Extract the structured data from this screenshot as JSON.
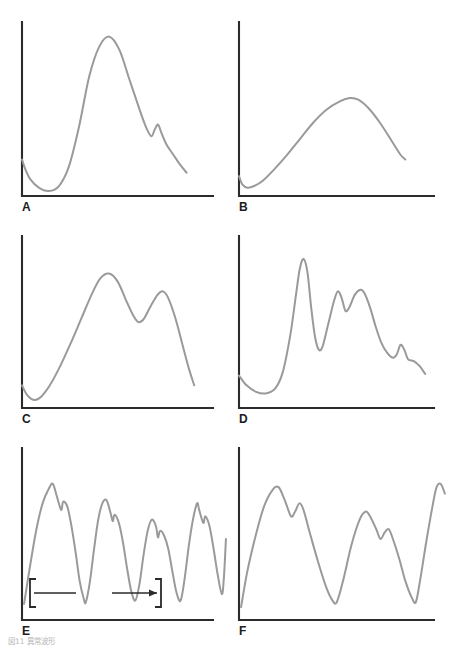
{
  "figure": {
    "caption": "図11 異常波形",
    "line_color": "#9a9a9a",
    "axis_color": "#2b2b2b",
    "background": "#ffffff"
  },
  "panels": [
    {
      "label": "A",
      "description": "single tall peak with small secondary notch on descending limb"
    },
    {
      "label": "B",
      "description": "single broad rounded low hump"
    },
    {
      "label": "C",
      "description": "bimodal curve with two rounded peaks"
    },
    {
      "label": "D",
      "description": "jagged multi-peaked waveform with tall spike and stepped tail"
    },
    {
      "label": "E",
      "description": "repeating irregular notched respiratory cycles"
    },
    {
      "label": "F",
      "description": "three repeating notched respiratory cycles"
    }
  ],
  "annotation": {
    "label": "吸気",
    "panel": "E"
  },
  "chart_data": {
    "type": "line",
    "title": "図11 異常波形",
    "grid": false,
    "legend": false,
    "xlabel": "",
    "ylabel": "",
    "panels": [
      {
        "id": "A",
        "label": "A",
        "xlim": [
          0,
          100
        ],
        "ylim": [
          0,
          100
        ],
        "points": [
          [
            0,
            22
          ],
          [
            2,
            16
          ],
          [
            5,
            10
          ],
          [
            10,
            5
          ],
          [
            16,
            3
          ],
          [
            22,
            6
          ],
          [
            28,
            18
          ],
          [
            34,
            42
          ],
          [
            40,
            72
          ],
          [
            46,
            90
          ],
          [
            52,
            96
          ],
          [
            58,
            88
          ],
          [
            64,
            70
          ],
          [
            70,
            52
          ],
          [
            74,
            41
          ],
          [
            77,
            36
          ],
          [
            79,
            40
          ],
          [
            81,
            43
          ],
          [
            83,
            38
          ],
          [
            86,
            31
          ],
          [
            90,
            25
          ],
          [
            94,
            19
          ],
          [
            98,
            14
          ]
        ]
      },
      {
        "id": "B",
        "label": "B",
        "xlim": [
          0,
          100
        ],
        "ylim": [
          0,
          100
        ],
        "points": [
          [
            0,
            12
          ],
          [
            2,
            7
          ],
          [
            5,
            5
          ],
          [
            9,
            6
          ],
          [
            14,
            9
          ],
          [
            20,
            15
          ],
          [
            28,
            24
          ],
          [
            36,
            34
          ],
          [
            44,
            44
          ],
          [
            52,
            52
          ],
          [
            60,
            57
          ],
          [
            66,
            59
          ],
          [
            71,
            58
          ],
          [
            77,
            53
          ],
          [
            84,
            44
          ],
          [
            91,
            33
          ],
          [
            96,
            25
          ],
          [
            99,
            22
          ]
        ]
      },
      {
        "id": "C",
        "label": "C",
        "xlim": [
          0,
          100
        ],
        "ylim": [
          0,
          100
        ],
        "points": [
          [
            0,
            14
          ],
          [
            3,
            8
          ],
          [
            7,
            5
          ],
          [
            11,
            7
          ],
          [
            16,
            14
          ],
          [
            22,
            26
          ],
          [
            28,
            40
          ],
          [
            34,
            55
          ],
          [
            40,
            70
          ],
          [
            45,
            80
          ],
          [
            50,
            83
          ],
          [
            55,
            78
          ],
          [
            60,
            66
          ],
          [
            64,
            57
          ],
          [
            67,
            53
          ],
          [
            70,
            55
          ],
          [
            74,
            63
          ],
          [
            78,
            70
          ],
          [
            81,
            72
          ],
          [
            84,
            68
          ],
          [
            88,
            56
          ],
          [
            92,
            40
          ],
          [
            96,
            24
          ],
          [
            99,
            14
          ]
        ]
      },
      {
        "id": "D",
        "label": "D",
        "xlim": [
          0,
          100
        ],
        "ylim": [
          0,
          100
        ],
        "points": [
          [
            0,
            20
          ],
          [
            4,
            14
          ],
          [
            9,
            10
          ],
          [
            14,
            9
          ],
          [
            19,
            12
          ],
          [
            23,
            22
          ],
          [
            27,
            45
          ],
          [
            30,
            70
          ],
          [
            32,
            86
          ],
          [
            34,
            92
          ],
          [
            36,
            84
          ],
          [
            38,
            62
          ],
          [
            40,
            44
          ],
          [
            42,
            36
          ],
          [
            44,
            38
          ],
          [
            47,
            52
          ],
          [
            50,
            66
          ],
          [
            52,
            72
          ],
          [
            54,
            68
          ],
          [
            56,
            60
          ],
          [
            58,
            62
          ],
          [
            61,
            70
          ],
          [
            64,
            73
          ],
          [
            66,
            71
          ],
          [
            69,
            62
          ],
          [
            72,
            50
          ],
          [
            75,
            40
          ],
          [
            78,
            34
          ],
          [
            81,
            31
          ],
          [
            83,
            33
          ],
          [
            85,
            39
          ],
          [
            87,
            36
          ],
          [
            89,
            30
          ],
          [
            92,
            29
          ],
          [
            95,
            26
          ],
          [
            98,
            21
          ]
        ]
      },
      {
        "id": "E",
        "label": "E",
        "xlim": [
          0,
          100
        ],
        "ylim": [
          0,
          100
        ],
        "points": [
          [
            1,
            10
          ],
          [
            4,
            34
          ],
          [
            7,
            56
          ],
          [
            10,
            72
          ],
          [
            13,
            81
          ],
          [
            15,
            84
          ],
          [
            17,
            76
          ],
          [
            19,
            68
          ],
          [
            20,
            73
          ],
          [
            22,
            70
          ],
          [
            24,
            58
          ],
          [
            26,
            42
          ],
          [
            28,
            24
          ],
          [
            30,
            13
          ],
          [
            31,
            11
          ],
          [
            33,
            24
          ],
          [
            35,
            44
          ],
          [
            37,
            62
          ],
          [
            39,
            72
          ],
          [
            41,
            74
          ],
          [
            43,
            66
          ],
          [
            44,
            61
          ],
          [
            45,
            65
          ],
          [
            47,
            60
          ],
          [
            49,
            48
          ],
          [
            51,
            32
          ],
          [
            53,
            18
          ],
          [
            55,
            12
          ],
          [
            57,
            22
          ],
          [
            59,
            40
          ],
          [
            61,
            55
          ],
          [
            63,
            62
          ],
          [
            65,
            58
          ],
          [
            66,
            51
          ],
          [
            67,
            55
          ],
          [
            69,
            52
          ],
          [
            71,
            44
          ],
          [
            73,
            30
          ],
          [
            75,
            17
          ],
          [
            77,
            12
          ],
          [
            79,
            26
          ],
          [
            81,
            46
          ],
          [
            83,
            62
          ],
          [
            85,
            72
          ],
          [
            86,
            68
          ],
          [
            88,
            60
          ],
          [
            89,
            64
          ],
          [
            91,
            58
          ],
          [
            93,
            44
          ],
          [
            95,
            28
          ],
          [
            97,
            16
          ],
          [
            98,
            26
          ],
          [
            99,
            50
          ]
        ]
      },
      {
        "id": "F",
        "label": "F",
        "xlim": [
          0,
          100
        ],
        "ylim": [
          0,
          100
        ],
        "points": [
          [
            1,
            8
          ],
          [
            4,
            30
          ],
          [
            8,
            52
          ],
          [
            12,
            70
          ],
          [
            16,
            80
          ],
          [
            19,
            82
          ],
          [
            22,
            74
          ],
          [
            25,
            64
          ],
          [
            27,
            67
          ],
          [
            29,
            72
          ],
          [
            31,
            68
          ],
          [
            34,
            54
          ],
          [
            38,
            36
          ],
          [
            42,
            20
          ],
          [
            45,
            12
          ],
          [
            47,
            11
          ],
          [
            50,
            24
          ],
          [
            54,
            46
          ],
          [
            58,
            62
          ],
          [
            61,
            67
          ],
          [
            63,
            64
          ],
          [
            66,
            56
          ],
          [
            68,
            50
          ],
          [
            70,
            54
          ],
          [
            72,
            56
          ],
          [
            74,
            50
          ],
          [
            77,
            38
          ],
          [
            80,
            24
          ],
          [
            83,
            14
          ],
          [
            85,
            11
          ],
          [
            87,
            24
          ],
          [
            90,
            48
          ],
          [
            93,
            70
          ],
          [
            95,
            82
          ],
          [
            97,
            84
          ],
          [
            99,
            78
          ]
        ]
      }
    ]
  }
}
